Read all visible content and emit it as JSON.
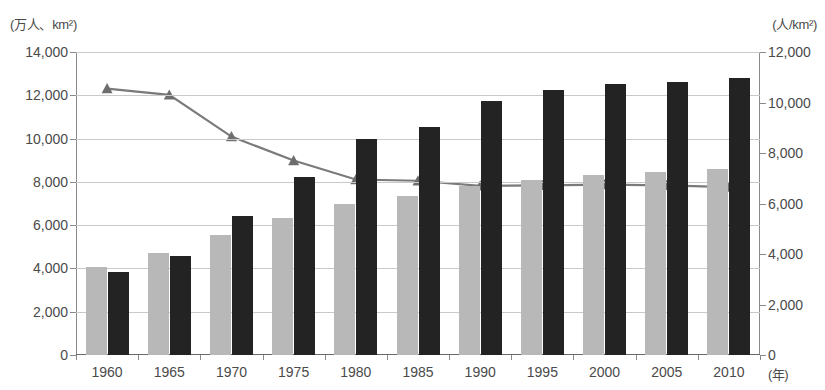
{
  "chart_data": {
    "type": "bar",
    "title": "",
    "xlabel": "(年)",
    "categories": [
      "1960",
      "1965",
      "1970",
      "1975",
      "1980",
      "1985",
      "1990",
      "1995",
      "2000",
      "2005",
      "2010"
    ],
    "axes": {
      "left": {
        "label": "(万人、km²)",
        "min": 0,
        "max": 14000,
        "step": 2000,
        "ticks": [
          "0",
          "2,000",
          "4,000",
          "6,000",
          "8,000",
          "10,000",
          "12,000",
          "14,000"
        ]
      },
      "right": {
        "label": "(人/km²)",
        "min": 0,
        "max": 12000,
        "step": 2000,
        "ticks": [
          "0",
          "2,000",
          "4,000",
          "6,000",
          "8,000",
          "10,000",
          "12,000"
        ]
      }
    },
    "grid": true,
    "legend": "none",
    "series": [
      {
        "name": "population-bar",
        "type": "bar",
        "axis": "left",
        "color": "#b8b8b8",
        "values": [
          4050,
          4700,
          5550,
          6350,
          7000,
          7350,
          7800,
          8100,
          8300,
          8450,
          8600
        ]
      },
      {
        "name": "area-bar",
        "type": "bar",
        "axis": "left",
        "color": "#232323",
        "values": [
          3820,
          4580,
          6430,
          8230,
          10000,
          10530,
          11750,
          12250,
          12500,
          12600,
          12800
        ]
      },
      {
        "name": "density-line",
        "type": "line",
        "axis": "right",
        "color": "#7a7a7a",
        "marker": "triangle",
        "values": [
          10550,
          10300,
          8650,
          7700,
          6950,
          6900,
          6700,
          6720,
          6750,
          6720,
          6650
        ]
      }
    ]
  }
}
